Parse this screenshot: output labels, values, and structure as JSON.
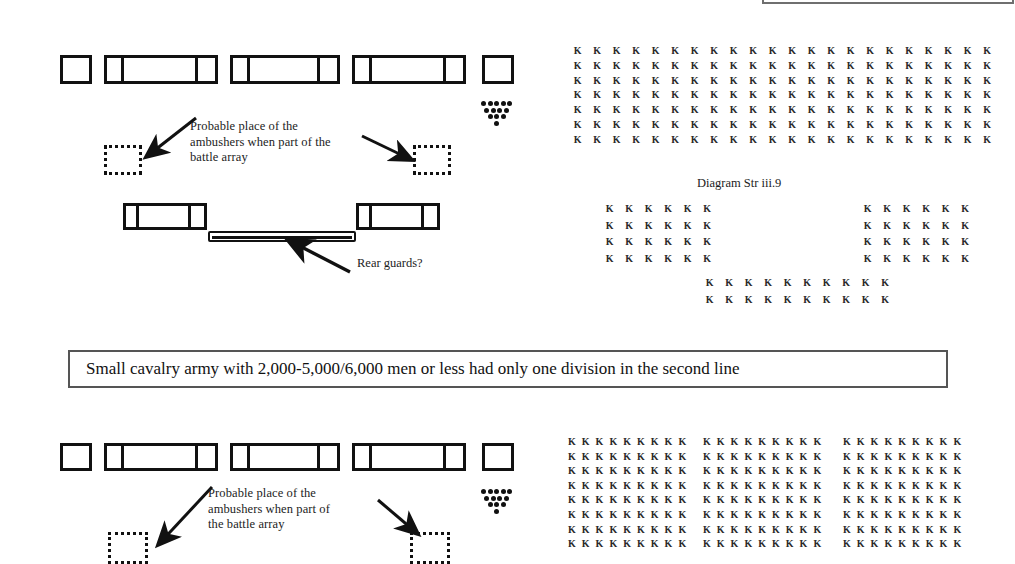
{
  "page": {
    "width": 1015,
    "height": 554,
    "background": "#ffffff",
    "ink": "#111111"
  },
  "sections": {
    "top": {
      "front_line_label": "front line of units",
      "ambush_note": "Probable place of the\nambushers when part of the\nbattle array",
      "rear_guard_label": "Rear guards?",
      "diagram_caption": "Diagram Str iii.9"
    },
    "banner": {
      "text": "Small cavalry army with 2,000-5,000/6,000 men or less had only one division in the second line"
    },
    "bottom": {
      "ambush_note": "Probable place of the\nambushers when part of\nthe battle array"
    }
  },
  "units_top_row": [
    {
      "name": "unit-left-flank-guard",
      "x": 60,
      "y": 55,
      "w": 32,
      "h": 29,
      "segments": [
        32
      ]
    },
    {
      "name": "unit-left-wing",
      "x": 104,
      "y": 55,
      "w": 114,
      "h": 29,
      "segments": [
        18,
        78,
        18
      ]
    },
    {
      "name": "unit-center",
      "x": 230,
      "y": 55,
      "w": 110,
      "h": 29,
      "segments": [
        18,
        74,
        18
      ]
    },
    {
      "name": "unit-right-wing",
      "x": 352,
      "y": 55,
      "w": 114,
      "h": 29,
      "segments": [
        18,
        78,
        18
      ]
    },
    {
      "name": "unit-right-flank-guard",
      "x": 482,
      "y": 55,
      "w": 32,
      "h": 29,
      "segments": [
        32
      ]
    }
  ],
  "units_second_row": [
    {
      "name": "unit-second-line-left",
      "x": 123,
      "y": 203,
      "w": 84,
      "h": 27,
      "segments": [
        14,
        56,
        14
      ]
    },
    {
      "name": "unit-second-line-right",
      "x": 356,
      "y": 203,
      "w": 84,
      "h": 27,
      "segments": [
        14,
        56,
        14
      ]
    }
  ],
  "units_bottom_row": [
    {
      "name": "unit-left-flank-guard-2",
      "x": 60,
      "y": 443,
      "w": 32,
      "h": 28,
      "segments": [
        32
      ]
    },
    {
      "name": "unit-left-wing-2",
      "x": 104,
      "y": 443,
      "w": 114,
      "h": 28,
      "segments": [
        18,
        78,
        18
      ]
    },
    {
      "name": "unit-center-2",
      "x": 230,
      "y": 443,
      "w": 110,
      "h": 28,
      "segments": [
        18,
        74,
        18
      ]
    },
    {
      "name": "unit-right-wing-2",
      "x": 352,
      "y": 443,
      "w": 114,
      "h": 28,
      "segments": [
        18,
        78,
        18
      ]
    },
    {
      "name": "unit-right-flank-guard-2",
      "x": 482,
      "y": 443,
      "w": 32,
      "h": 28,
      "segments": [
        32
      ]
    }
  ],
  "ambush_boxes": [
    {
      "name": "ambush-box-top-left",
      "x": 104,
      "y": 145,
      "w": 38,
      "h": 30
    },
    {
      "name": "ambush-box-top-right",
      "x": 413,
      "y": 145,
      "w": 38,
      "h": 30
    },
    {
      "name": "ambush-box-bottom-left",
      "x": 108,
      "y": 532,
      "w": 40,
      "h": 32
    },
    {
      "name": "ambush-box-bottom-right",
      "x": 410,
      "y": 532,
      "w": 40,
      "h": 32
    }
  ],
  "rear_guard_bar": {
    "x": 208,
    "y": 231,
    "w": 148,
    "h": 11
  },
  "commander_marker_top": {
    "x": 481,
    "y": 92,
    "rows": [
      5,
      4,
      3,
      1
    ],
    "dot": 5
  },
  "commander_marker_bottom": {
    "x": 481,
    "y": 480,
    "rows": [
      5,
      4,
      3,
      1
    ],
    "dot": 5
  },
  "banner_box": {
    "x": 68,
    "y": 350,
    "w": 880,
    "h": 38
  },
  "k_glyph": "K",
  "k_formations": [
    {
      "name": "k-block-top-main",
      "x": 568,
      "y": 45,
      "cols": 22,
      "rows": 7,
      "cw": 19.5,
      "rh": 14.8
    },
    {
      "name": "k-block-mid-left",
      "x": 600,
      "y": 203,
      "cols": 6,
      "rows": 4,
      "cw": 19.5,
      "rh": 16.5
    },
    {
      "name": "k-block-mid-right",
      "x": 858,
      "y": 203,
      "cols": 6,
      "rows": 4,
      "cw": 19.5,
      "rh": 16.5
    },
    {
      "name": "k-block-mid-center-rear",
      "x": 700,
      "y": 277,
      "cols": 10,
      "rows": 2,
      "cw": 19.5,
      "rh": 16.5
    },
    {
      "name": "k-block-bottom-left",
      "x": 565,
      "y": 436,
      "cols": 9,
      "rows": 8,
      "cw": 13.8,
      "rh": 14.6
    },
    {
      "name": "k-block-bottom-center",
      "x": 700,
      "y": 436,
      "cols": 9,
      "rows": 8,
      "cw": 13.8,
      "rh": 14.6
    },
    {
      "name": "k-block-bottom-right",
      "x": 840,
      "y": 436,
      "cols": 9,
      "rows": 8,
      "cw": 13.8,
      "rh": 14.6
    }
  ],
  "labels": [
    {
      "name": "ambush-note-top",
      "x": 190,
      "y": 119,
      "ref": "sections.top.ambush_note"
    },
    {
      "name": "rear-guards-label",
      "x": 357,
      "y": 256,
      "ref": "sections.top.rear_guard_label"
    },
    {
      "name": "diagram-caption",
      "x": 697,
      "y": 176,
      "ref": "sections.top.diagram_caption"
    },
    {
      "name": "ambush-note-bottom",
      "x": 208,
      "y": 486,
      "ref": "sections.bottom.ambush_note"
    }
  ]
}
